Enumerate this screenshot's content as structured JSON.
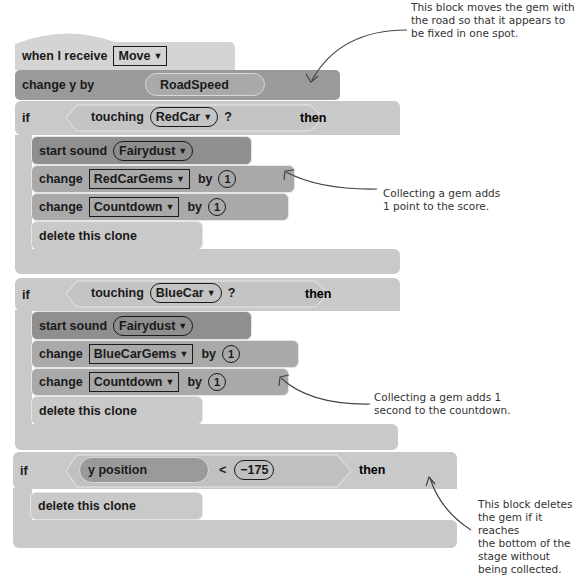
{
  "hat": {
    "label": "when I receive",
    "message": "Move"
  },
  "change_y": {
    "label": "change y by",
    "value": "RoadSpeed"
  },
  "if_red": {
    "if": "if",
    "then": "then",
    "condition": {
      "label": "touching",
      "target": "RedCar",
      "suffix": "?"
    },
    "sound": {
      "label": "start sound",
      "value": "Fairydust"
    },
    "change1": {
      "label": "change",
      "var": "RedCarGems",
      "by": "by",
      "amount": "1"
    },
    "change2": {
      "label": "change",
      "var": "Countdown",
      "by": "by",
      "amount": "1"
    },
    "delete": "delete this clone"
  },
  "if_blue": {
    "if": "if",
    "then": "then",
    "condition": {
      "label": "touching",
      "target": "BlueCar",
      "suffix": "?"
    },
    "sound": {
      "label": "start sound",
      "value": "Fairydust"
    },
    "change1": {
      "label": "change",
      "var": "BlueCarGems",
      "by": "by",
      "amount": "1"
    },
    "change2": {
      "label": "change",
      "var": "Countdown",
      "by": "by",
      "amount": "1"
    },
    "delete": "delete this clone"
  },
  "if_bottom": {
    "if": "if",
    "then": "then",
    "condition": {
      "reporter": "y position",
      "op": "<",
      "value": "−175"
    },
    "delete": "delete this clone"
  },
  "annotations": {
    "top": [
      "This block moves the gem with",
      "the road so that it appears to",
      "be fixed in one spot."
    ],
    "red": [
      "Collecting a gem adds",
      "1 point to the score."
    ],
    "blue": [
      "Collecting a gem adds 1",
      "second to the countdown."
    ],
    "bottom": [
      "This block deletes",
      "the gem if it reaches",
      "the bottom of the",
      "stage without",
      "being collected."
    ]
  },
  "colors": {
    "hat": "#d4d4d4",
    "motion": "#9a9a9a",
    "control": "#c9c9c9",
    "sound": "#8f8f8f",
    "variables": "#a9a9a9",
    "text": "#1a1a1a"
  }
}
